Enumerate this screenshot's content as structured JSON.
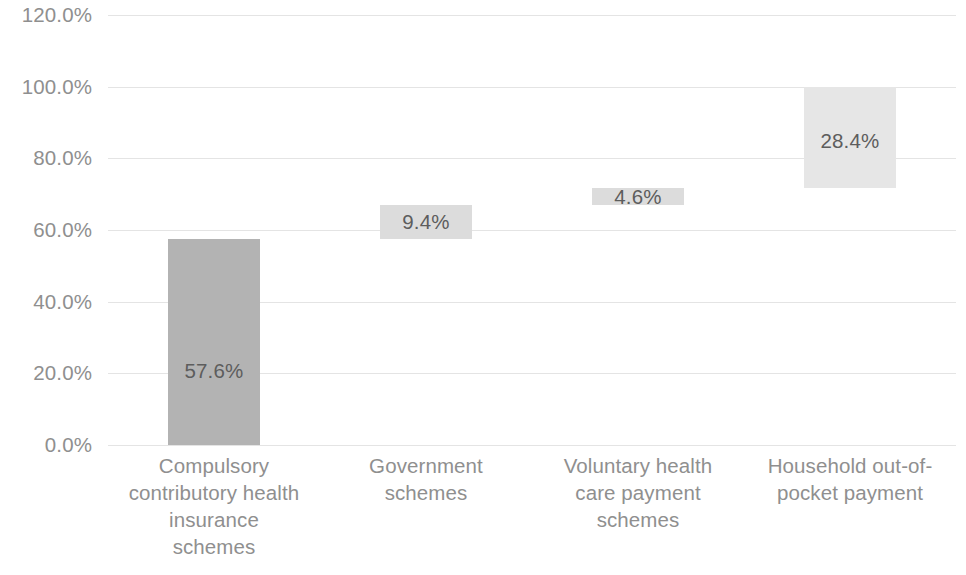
{
  "chart_data": {
    "type": "bar",
    "subtype": "waterfall",
    "title": "",
    "xlabel": "",
    "ylabel": "",
    "categories": [
      "Compulsory contributory health insurance schemes",
      "Government schemes",
      "Voluntary health care payment schemes",
      "Household out-of-pocket payment"
    ],
    "values": [
      57.6,
      9.4,
      4.6,
      28.4
    ],
    "data_labels": [
      "57.6%",
      "9.4%",
      "4.6%",
      "28.4%"
    ],
    "cumulative_base": [
      0.0,
      57.6,
      67.0,
      71.6
    ],
    "cumulative_top": [
      57.6,
      67.0,
      71.6,
      100.0
    ],
    "ylim": [
      0,
      120
    ],
    "ytick_values": [
      0,
      20,
      40,
      60,
      80,
      100,
      120
    ],
    "ytick_labels": [
      "0.0%",
      "20.0%",
      "40.0%",
      "60.0%",
      "80.0%",
      "100.0%",
      "120.0%"
    ],
    "grid": true,
    "legend": null,
    "legend_position": "none",
    "bar_colors": [
      "#b3b3b3",
      "#dcdcdc",
      "#dcdcdc",
      "#e6e6e6"
    ],
    "label_text_color": "#5d5d5d",
    "axis_text_color": "#8f8f8f",
    "gridline_color": "#e4e4e4",
    "background_color": "#ffffff",
    "annotations": []
  },
  "axis_labels": {
    "y": [
      {
        "text": "120.0%",
        "value": 120
      },
      {
        "text": "100.0%",
        "value": 100
      },
      {
        "text": "80.0%",
        "value": 80
      },
      {
        "text": "60.0%",
        "value": 60
      },
      {
        "text": "40.0%",
        "value": 40
      },
      {
        "text": "20.0%",
        "value": 20
      },
      {
        "text": "0.0%",
        "value": 0
      }
    ],
    "x": [
      {
        "lines": [
          "Compulsory",
          "contributory health",
          "insurance",
          "schemes"
        ]
      },
      {
        "lines": [
          "Government",
          "schemes"
        ]
      },
      {
        "lines": [
          "Voluntary health",
          "care payment",
          "schemes"
        ]
      },
      {
        "lines": [
          "Household out-of-",
          "pocket payment"
        ]
      }
    ]
  }
}
